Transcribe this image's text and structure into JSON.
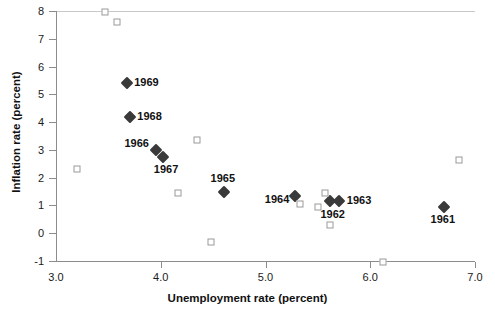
{
  "chart_data": {
    "type": "scatter",
    "title": "",
    "xlabel": "Unemployment rate (percent)",
    "ylabel": "Inflation rate (percent)",
    "xlim": [
      3.0,
      7.0
    ],
    "ylim": [
      -1,
      8
    ],
    "xticks": [
      "3.0",
      "4.0",
      "5.0",
      "6.0",
      "7.0"
    ],
    "xtick_values": [
      3.0,
      4.0,
      5.0,
      6.0,
      7.0
    ],
    "yticks": [
      "8",
      "7",
      "6",
      "5",
      "4",
      "3",
      "2",
      "1",
      "0",
      "-1"
    ],
    "ytick_values": [
      8,
      7,
      6,
      5,
      4,
      3,
      2,
      1,
      0,
      -1
    ],
    "grid": false,
    "legend": "none",
    "zero_reference_line": 0,
    "series": [
      {
        "name": "labeled-years",
        "marker": "filled-diamond",
        "color": "#3a3a3a",
        "points": [
          {
            "label": "1969",
            "x": 3.68,
            "y": 5.4,
            "label_pos": "right"
          },
          {
            "label": "1968",
            "x": 3.71,
            "y": 4.2,
            "label_pos": "right"
          },
          {
            "label": "1966",
            "x": 3.95,
            "y": 3.0,
            "label_pos": "left"
          },
          {
            "label": "1967",
            "x": 4.02,
            "y": 2.75,
            "label_pos": "below-right"
          },
          {
            "label": "1965",
            "x": 4.6,
            "y": 1.5,
            "label_pos": "above"
          },
          {
            "label": "1964",
            "x": 5.28,
            "y": 1.35,
            "label_pos": "left"
          },
          {
            "label": "1962",
            "x": 5.62,
            "y": 1.15,
            "label_pos": "below"
          },
          {
            "label": "1963",
            "x": 5.7,
            "y": 1.15,
            "label_pos": "right"
          },
          {
            "label": "1961",
            "x": 6.7,
            "y": 0.95,
            "label_pos": "below"
          }
        ]
      },
      {
        "name": "other-years",
        "marker": "open-square",
        "color": "#9a9a9a",
        "points": [
          {
            "label": "",
            "x": 3.47,
            "y": 7.95
          },
          {
            "label": "",
            "x": 3.58,
            "y": 7.6
          },
          {
            "label": "",
            "x": 3.2,
            "y": 2.3
          },
          {
            "label": "",
            "x": 4.35,
            "y": 3.35
          },
          {
            "label": "",
            "x": 4.16,
            "y": 1.45
          },
          {
            "label": "",
            "x": 4.48,
            "y": -0.3
          },
          {
            "label": "",
            "x": 5.33,
            "y": 1.05
          },
          {
            "label": "",
            "x": 5.57,
            "y": 1.45
          },
          {
            "label": "",
            "x": 5.5,
            "y": 0.95
          },
          {
            "label": "",
            "x": 5.62,
            "y": 0.3
          },
          {
            "label": "",
            "x": 6.12,
            "y": -1.05
          },
          {
            "label": "",
            "x": 6.85,
            "y": 2.65
          }
        ]
      }
    ]
  }
}
